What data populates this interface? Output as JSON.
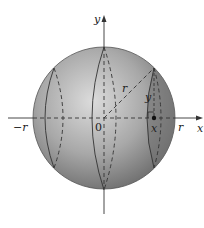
{
  "diagram": {
    "labels": {
      "y_axis": "y",
      "x_axis": "x",
      "origin": "0",
      "neg_r": "−r",
      "pos_r": "r",
      "radius": "r",
      "slice_height": "y",
      "slice_position": "x"
    },
    "colors": {
      "sphere_dark": "#6e6e6e",
      "sphere_light": "#d2d2d2",
      "slice_shade": "#7a7a7a",
      "axis": "#333333",
      "background": "#ffffff"
    }
  }
}
